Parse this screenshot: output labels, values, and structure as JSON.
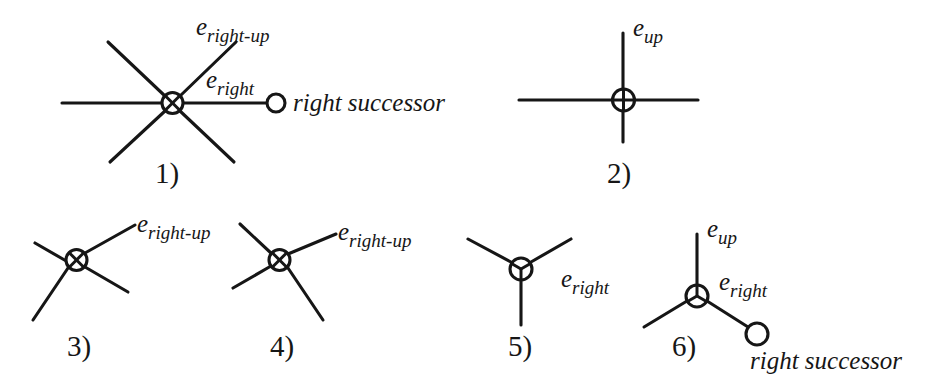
{
  "figure": {
    "background_color": "#ffffff",
    "ink_color": "#161616",
    "caption_style": "numbered-vertex-configurations",
    "panels": [
      {
        "id": "panel-1",
        "number_label": "1)",
        "vertex_marker": "crossed-circle",
        "degree": 6,
        "edge_labels": [
          "e",
          "right-up",
          "e",
          "right"
        ],
        "label_e_right_up_base": "e",
        "label_e_right_up_sub": "right-up",
        "label_e_right_base": "e",
        "label_e_right_sub": "right",
        "successor_label": "right successor",
        "has_successor_node": true
      },
      {
        "id": "panel-2",
        "number_label": "2)",
        "vertex_marker": "plus-circle",
        "degree": 4,
        "label_e_up_base": "e",
        "label_e_up_sub": "up",
        "has_successor_node": false
      },
      {
        "id": "panel-3",
        "number_label": "3)",
        "vertex_marker": "crossed-circle",
        "degree": 4,
        "label_e_right_up_base": "e",
        "label_e_right_up_sub": "right-up",
        "has_successor_node": false
      },
      {
        "id": "panel-4",
        "number_label": "4)",
        "vertex_marker": "crossed-circle",
        "degree": 4,
        "label_e_right_up_base": "e",
        "label_e_right_up_sub": "right-up",
        "has_successor_node": false
      },
      {
        "id": "panel-5",
        "number_label": "5)",
        "vertex_marker": "y-circle",
        "degree": 3,
        "label_e_right_base": "e",
        "label_e_right_sub": "right",
        "has_successor_node": false
      },
      {
        "id": "panel-6",
        "number_label": "6)",
        "vertex_marker": "y-circle",
        "degree": 3,
        "label_e_up_base": "e",
        "label_e_up_sub": "up",
        "label_e_right_base": "e",
        "label_e_right_sub": "right",
        "successor_label": "right successor",
        "has_successor_node": true
      }
    ]
  }
}
